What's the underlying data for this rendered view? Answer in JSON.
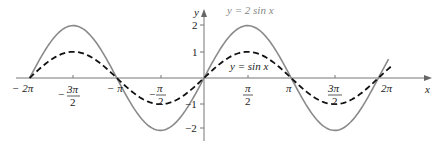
{
  "chart_data": {
    "type": "line",
    "title": "",
    "xlabel": "x",
    "ylabel": "y",
    "xlim": [
      -6.2832,
      6.7
    ],
    "ylim": [
      -2.3,
      2.4
    ],
    "grid": false,
    "x_ticks": [
      "-2π",
      "-3π/2",
      "-π",
      "-π/2",
      "π/2",
      "π",
      "3π/2",
      "2π"
    ],
    "x_tick_values": [
      -6.2832,
      -4.7124,
      -3.1416,
      -1.5708,
      1.5708,
      3.1416,
      4.7124,
      6.2832
    ],
    "y_ticks": [
      "2",
      "1",
      "-1",
      "-2"
    ],
    "y_tick_values": [
      2,
      1,
      -1,
      -2
    ],
    "series": [
      {
        "name": "y = 2 sin x",
        "style": "solid",
        "color": "#8a8a8a",
        "x_range": [
          -6.2832,
          6.65
        ],
        "x": [
          -6.2832,
          -4.7124,
          -3.1416,
          -1.5708,
          0,
          1.5708,
          3.1416,
          4.7124,
          6.2832
        ],
        "values": [
          0,
          2,
          0,
          -2,
          0,
          2,
          0,
          -2,
          0
        ]
      },
      {
        "name": "y = sin x",
        "style": "dashed",
        "color": "#111111",
        "x_range": [
          -6.2832,
          6.75
        ],
        "x": [
          -6.2832,
          -4.7124,
          -3.1416,
          -1.5708,
          0,
          1.5708,
          3.1416,
          4.7124,
          6.2832
        ],
        "values": [
          0,
          1,
          0,
          -1,
          0,
          1,
          0,
          -1,
          0
        ]
      }
    ],
    "annotations": [
      {
        "text": "y = 2 sin x",
        "near": "peak of 2 sin x at π/2"
      },
      {
        "text": "y = sin x",
        "near": "right of origin above x-axis"
      }
    ]
  },
  "labels": {
    "x_axis": "x",
    "y_axis": "y",
    "curve_2sin": "y = 2 sin x",
    "curve_sin": "y = sin x",
    "xt": [
      "− 2π",
      "3π",
      "2",
      "− π",
      "π",
      "2",
      "π",
      "2",
      "π",
      "3π",
      "2",
      "2π"
    ],
    "yt": [
      "2",
      "1",
      "−1",
      "−2"
    ]
  }
}
